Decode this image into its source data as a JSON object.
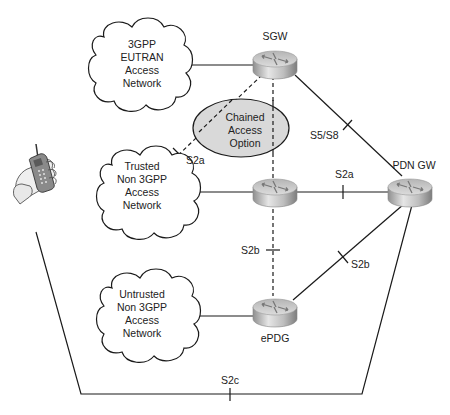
{
  "nodes": {
    "sgw": {
      "label": "SGW"
    },
    "pdn_gw": {
      "label": "PDN GW"
    },
    "trusted_gw": {
      "label": ""
    },
    "epdg": {
      "label": "ePDG"
    }
  },
  "clouds": [
    {
      "lines": [
        "3GPP",
        "EUTRAN",
        "Access",
        "Network"
      ]
    },
    {
      "lines": [
        "Trusted",
        "Non 3GPP",
        "Access",
        "Network"
      ]
    },
    {
      "lines": [
        "Untrusted",
        "Non 3GPP",
        "Access",
        "Network"
      ]
    }
  ],
  "chained_option": {
    "lines": [
      "Chained",
      "Access",
      "Option"
    ]
  },
  "interfaces": {
    "s2a_chained": "S2a",
    "s5_s8": "S5/S8",
    "s2a_trusted": "S2a",
    "s2b_dashed": "S2b",
    "s2b_epdg": "S2b",
    "s2c": "S2c"
  },
  "colors": {
    "line": "#1a1a1a",
    "ellipse_fill": "#d9d9d9",
    "router_top": "#d0d0d0",
    "router_side": "#a8a8a8"
  }
}
